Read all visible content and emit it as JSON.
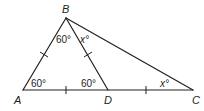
{
  "diagram": {
    "type": "geometry-triangle",
    "stroke_color": "#231f20",
    "vertices": {
      "A": {
        "label": "A",
        "x": 23,
        "y": 90
      },
      "B": {
        "label": "B",
        "x": 66,
        "y": 18
      },
      "C": {
        "label": "C",
        "x": 193,
        "y": 90
      },
      "D": {
        "label": "D",
        "x": 108,
        "y": 90
      }
    },
    "segments": [
      "AB",
      "BC",
      "AC",
      "BD"
    ],
    "congruent_segments": [
      "AB",
      "BD",
      "AD",
      "DC"
    ],
    "angles": {
      "angle_A": "60°",
      "angle_ABD": "60°",
      "angle_DBC": "x°",
      "angle_BDA": "60°",
      "angle_C": "x°"
    }
  }
}
